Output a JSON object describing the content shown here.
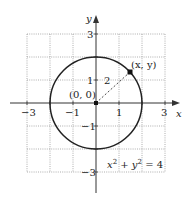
{
  "diagram": {
    "type": "circle-on-coordinate-plane",
    "axes": {
      "x_label": "x",
      "y_label": "y",
      "x_ticks": [
        {
          "value": -3,
          "label": "−3"
        },
        {
          "value": -1,
          "label": "−1"
        },
        {
          "value": 1,
          "label": "1"
        },
        {
          "value": 3,
          "label": "3"
        }
      ],
      "y_ticks": [
        {
          "value": 3,
          "label": "3"
        },
        {
          "value": 1,
          "label": "1"
        },
        {
          "value": -1,
          "label": "−1"
        },
        {
          "value": -3,
          "label": "−3"
        }
      ],
      "range": [
        -3,
        3
      ]
    },
    "circle": {
      "center_label": "(0, 0)",
      "radius": 2,
      "radius_label": "2",
      "point_label": "(x, y)",
      "equation": "x² + y² = 4",
      "equation_parts": {
        "x": "x",
        "x_exp": "2",
        "plus": " + ",
        "y": "y",
        "y_exp": "2",
        "rhs": " = 4"
      }
    },
    "colors": {
      "curve": "#222222",
      "grid": "#9a9a9a",
      "axis": "#333333"
    }
  }
}
